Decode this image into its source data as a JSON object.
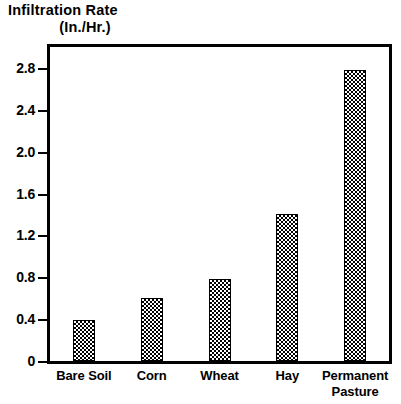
{
  "chart_data": {
    "type": "bar",
    "title": "Infiltration Rate",
    "subtitle": "(In./Hr.)",
    "xlabel": "",
    "ylabel": "Infiltration Rate (In./Hr.)",
    "categories": [
      "Bare Soil",
      "Corn",
      "Wheat",
      "Hay",
      "Permanent Pasture"
    ],
    "values": [
      0.39,
      0.6,
      0.78,
      1.4,
      2.78
    ],
    "ylim": [
      0,
      3.0
    ],
    "yticks": [
      0,
      0.4,
      0.8,
      1.2,
      1.6,
      2.0,
      2.4,
      2.8
    ],
    "ytick_labels": [
      "0",
      "0.4",
      "0.8",
      "1.2",
      "1.6",
      "2.0",
      "2.4",
      "2.8"
    ],
    "grid": false,
    "legend": "none",
    "bar_fill": "checkerboard",
    "colors": {
      "axis": "#000000",
      "bar_outline": "#000000",
      "bar_fill_dark": "#000000",
      "bar_fill_light": "#ffffff",
      "background": "#ffffff"
    }
  },
  "categories_display": [
    {
      "line1": "Bare Soil",
      "line2": ""
    },
    {
      "line1": "Corn",
      "line2": ""
    },
    {
      "line1": "Wheat",
      "line2": ""
    },
    {
      "line1": "Hay",
      "line2": ""
    },
    {
      "line1": "Permanent",
      "line2": "Pasture"
    }
  ]
}
